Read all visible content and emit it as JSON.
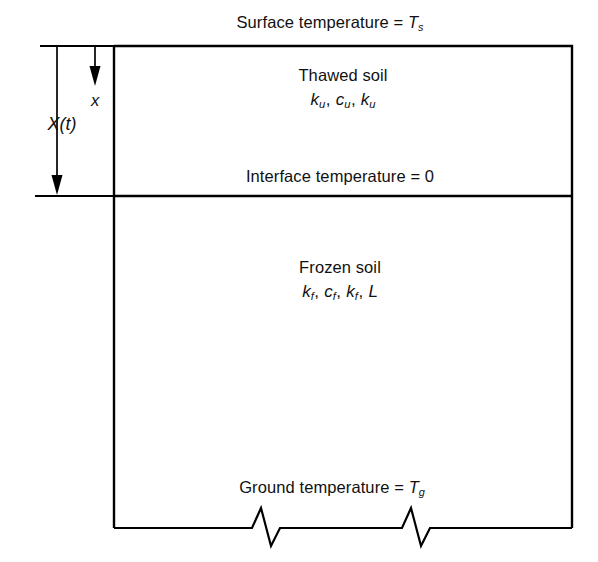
{
  "figure": {
    "title_text": "Surface temperature = T",
    "surface_label": {
      "prefix": "Surface temperature = ",
      "symbol": "T",
      "subscript": "s"
    },
    "interface_label": {
      "text": "Interface temperature = 0"
    },
    "ground_label": {
      "prefix": "Ground temperature = ",
      "symbol": "T",
      "subscript": "g"
    },
    "upper_region": {
      "name": "Thawed soil",
      "properties": [
        {
          "symbol": "k",
          "subscript": "u"
        },
        {
          "symbol": "c",
          "subscript": "u"
        },
        {
          "symbol": "k",
          "subscript": "u"
        }
      ],
      "separator": ", "
    },
    "lower_region": {
      "name": "Frozen soil",
      "properties": [
        {
          "symbol": "k",
          "subscript": "f"
        },
        {
          "symbol": "c",
          "subscript": "f"
        },
        {
          "symbol": "k",
          "subscript": "f"
        },
        {
          "symbol": "L",
          "subscript": ""
        }
      ],
      "separator": ", "
    },
    "depth_axis": {
      "thaw_depth_label": "X(t)",
      "coordinate_label": "x"
    },
    "colors": {
      "line": "#000000",
      "text": "#111111",
      "background": "#ffffff"
    }
  }
}
